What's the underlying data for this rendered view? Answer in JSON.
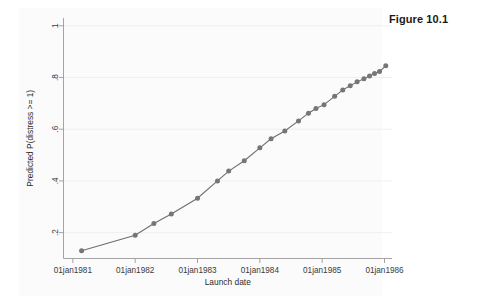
{
  "figure": {
    "caption": "Figure 10.1"
  },
  "chart_data": {
    "type": "line",
    "title": "",
    "subtitle": "",
    "xlabel": "Launch date",
    "ylabel": "Predicted P(distress >= 1)",
    "grid": true,
    "legend": false,
    "legend_position": "none",
    "marker": "circle",
    "line_color": "#6e6e6e",
    "marker_color": "#767676",
    "xtick_labels": [
      "01jan1981",
      "01jan1982",
      "01jan1983",
      "01jan1984",
      "01jan1985",
      "01jan1986"
    ],
    "xtick_values": [
      1981.0,
      1982.0,
      1983.0,
      1984.0,
      1985.0,
      1986.0
    ],
    "ytick_labels": [
      ".2",
      ".4",
      ".6",
      ".8",
      "1"
    ],
    "ytick_values": [
      0.2,
      0.4,
      0.6,
      0.8,
      1.0
    ],
    "xlim": [
      1980.85,
      1986.12
    ],
    "ylim": [
      0.1,
      1.03
    ],
    "series": [
      {
        "name": "Predicted P(distress >= 1)",
        "x": [
          1981.14,
          1982.0,
          1982.3,
          1982.58,
          1983.0,
          1983.32,
          1983.5,
          1983.75,
          1984.0,
          1984.18,
          1984.4,
          1984.62,
          1984.78,
          1984.9,
          1985.03,
          1985.2,
          1985.33,
          1985.45,
          1985.56,
          1985.67,
          1985.76,
          1985.84,
          1985.92,
          1986.02
        ],
        "y": [
          0.13,
          0.19,
          0.235,
          0.272,
          0.333,
          0.4,
          0.438,
          0.478,
          0.528,
          0.563,
          0.593,
          0.632,
          0.662,
          0.68,
          0.695,
          0.727,
          0.752,
          0.768,
          0.783,
          0.795,
          0.806,
          0.815,
          0.823,
          0.845
        ]
      }
    ]
  }
}
